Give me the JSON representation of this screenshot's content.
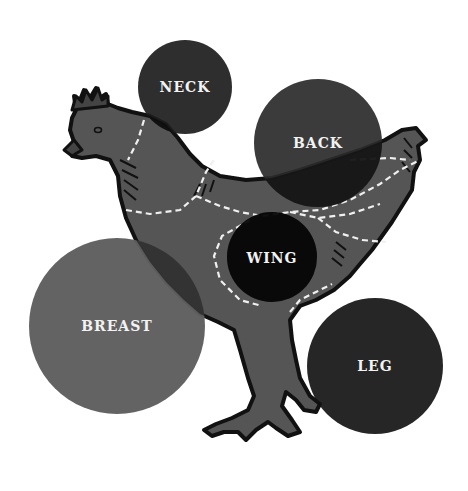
{
  "diagram": {
    "colors": {
      "background": "#ffffff",
      "body": "#555555",
      "outline": "#111111",
      "cut_lines": "#f0f0f0",
      "label_text": "#f2f2f2"
    },
    "cuts": [
      {
        "id": "neck",
        "label": "NECK",
        "cx": 185,
        "cy": 87,
        "r": 47,
        "fill": "#1c1c1c"
      },
      {
        "id": "back",
        "label": "BACK",
        "cx": 318,
        "cy": 143,
        "r": 64,
        "fill": "#2a2a2a"
      },
      {
        "id": "wing",
        "label": "WING",
        "cx": 272,
        "cy": 257,
        "r": 45,
        "fill": "#0d0d0d"
      },
      {
        "id": "breast",
        "label": "BREAST",
        "cx": 117,
        "cy": 326,
        "r": 88,
        "fill": "#5e5e5e"
      },
      {
        "id": "leg",
        "label": "LEG",
        "cx": 375,
        "cy": 366,
        "r": 68,
        "fill": "#141414"
      }
    ]
  }
}
